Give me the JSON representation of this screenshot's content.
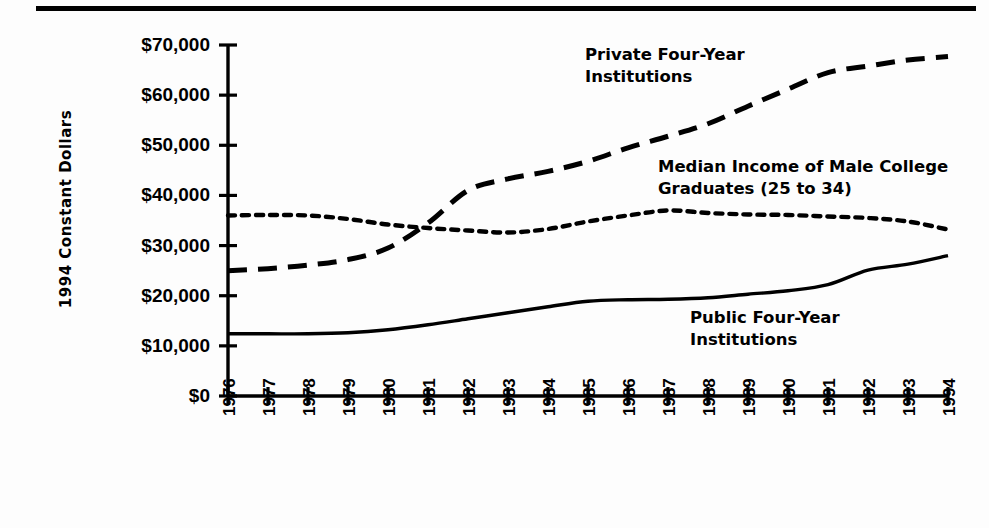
{
  "chart_data": {
    "type": "line",
    "title": "",
    "xlabel": "",
    "ylabel": "1994 Constant Dollars",
    "x": [
      1976,
      1977,
      1978,
      1979,
      1980,
      1981,
      1982,
      1983,
      1984,
      1985,
      1986,
      1987,
      1988,
      1989,
      1990,
      1991,
      1992,
      1993,
      1994
    ],
    "categories": [
      "1976",
      "1977",
      "1978",
      "1979",
      "1980",
      "1981",
      "1982",
      "1983",
      "1984",
      "1985",
      "1986",
      "1987",
      "1988",
      "1989",
      "1990",
      "1991",
      "1992",
      "1993",
      "1994"
    ],
    "ylim": [
      0,
      70000
    ],
    "xlim": [
      1976,
      1994
    ],
    "yticks": [
      0,
      10000,
      20000,
      30000,
      40000,
      50000,
      60000,
      70000
    ],
    "ytick_labels": [
      "$0",
      "$10,000",
      "$20,000",
      "$30,000",
      "$40,000",
      "$50,000",
      "$60,000",
      "$70,000"
    ],
    "grid": false,
    "legend_position": "inline-annotations",
    "series": [
      {
        "name": "Private Four-Year Institutions",
        "style": "long-dashed",
        "values": [
          25000,
          25400,
          26100,
          27200,
          29500,
          34500,
          41000,
          43300,
          44800,
          46800,
          49500,
          51800,
          54300,
          57800,
          61200,
          64500,
          65800,
          67000,
          67700
        ]
      },
      {
        "name": "Median Income of Male College Graduates (25 to 34)",
        "style": "dotted",
        "values": [
          36000,
          36100,
          36000,
          35300,
          34200,
          33500,
          33000,
          32600,
          33300,
          34800,
          36000,
          37000,
          36500,
          36200,
          36100,
          35800,
          35500,
          34800,
          33200
        ]
      },
      {
        "name": "Public Four-Year Institutions",
        "style": "solid",
        "values": [
          12400,
          12400,
          12400,
          12600,
          13200,
          14200,
          15400,
          16600,
          17800,
          18900,
          19200,
          19300,
          19600,
          20300,
          21000,
          22200,
          25100,
          26300,
          28000
        ]
      }
    ],
    "annotations": [
      {
        "id": "private",
        "text": "Private  Four-Year\nInstitutions",
        "series": "Private Four-Year Institutions"
      },
      {
        "id": "median",
        "text": "Median Income of Male College\nGraduates (25 to 34)",
        "series": "Median Income of Male College Graduates (25 to 34)"
      },
      {
        "id": "public",
        "text": "Public  Four-Year\nInstitutions",
        "series": "Public Four-Year Institutions"
      }
    ],
    "colors": {
      "line": "#000000",
      "background": "#ffffff"
    }
  }
}
